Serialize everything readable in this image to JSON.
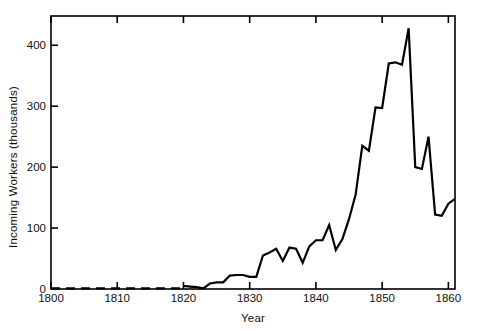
{
  "chart_data": {
    "type": "line",
    "title": "",
    "xlabel": "Year",
    "ylabel": "Incoming Workers (thousands)",
    "xlim": [
      1800,
      1861
    ],
    "ylim": [
      0,
      448
    ],
    "grid": false,
    "legend": null,
    "xticks": [
      1800,
      1810,
      1820,
      1830,
      1840,
      1850,
      1860
    ],
    "xtick_labels": [
      "1800",
      "1810",
      "1820",
      "1830",
      "1840",
      "1850",
      "1860"
    ],
    "yticks": [
      0,
      100,
      200,
      300,
      400
    ],
    "ytick_labels": [
      "0",
      "100",
      "200",
      "300",
      "400"
    ],
    "series": [
      {
        "name": "Incoming Workers",
        "style": "dashed",
        "note": "Estimated / sparse early record shown as dashed segment",
        "x": [
          1800,
          1820
        ],
        "values": [
          1,
          1
        ]
      },
      {
        "name": "Incoming Workers",
        "style": "solid",
        "x": [
          1820,
          1821,
          1822,
          1823,
          1824,
          1825,
          1826,
          1827,
          1828,
          1829,
          1830,
          1831,
          1832,
          1833,
          1834,
          1835,
          1836,
          1837,
          1838,
          1839,
          1840,
          1841,
          1842,
          1843,
          1844,
          1845,
          1846,
          1847,
          1848,
          1849,
          1850,
          1851,
          1852,
          1853,
          1854,
          1855,
          1856,
          1857,
          1858,
          1859,
          1860,
          1861
        ],
        "values": [
          5,
          4,
          3,
          1,
          9,
          11,
          11,
          22,
          23,
          23,
          20,
          20,
          55,
          60,
          66,
          46,
          68,
          66,
          43,
          70,
          80,
          80,
          105,
          64,
          82,
          115,
          155,
          235,
          227,
          298,
          297,
          370,
          372,
          368,
          428,
          200,
          197,
          250,
          122,
          120,
          140,
          148
        ]
      }
    ]
  },
  "axes": {
    "x_tick_positions_px": [
      51,
      118,
      185,
      253,
      320,
      388,
      455
    ],
    "y_tick_positions_px": [
      289,
      227,
      166,
      106,
      46
    ]
  },
  "style": {
    "line_color": "#000000",
    "axis_color": "#000000",
    "background": "#ffffff",
    "line_width": 2.2
  }
}
